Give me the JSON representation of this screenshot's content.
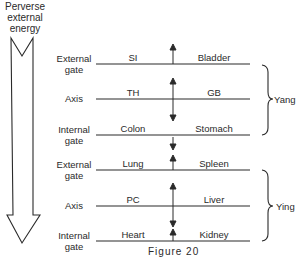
{
  "title": [
    "Perverse",
    "external",
    "energy"
  ],
  "rows": [
    {
      "gate": [
        "External",
        "gate"
      ],
      "left": "SI",
      "right": "Bladder"
    },
    {
      "gate": [
        "Axis"
      ],
      "left": "TH",
      "right": "GB"
    },
    {
      "gate": [
        "Internal",
        "gate"
      ],
      "left": "Colon",
      "right": "Stomach"
    },
    {
      "gate": [
        "External",
        "gate"
      ],
      "left": "Lung",
      "right": "Spleen"
    },
    {
      "gate": [
        "Axis"
      ],
      "left": "PC",
      "right": "Liver"
    },
    {
      "gate": [
        "Internal",
        "gate"
      ],
      "left": "Heart",
      "right": "Kidney"
    }
  ],
  "groups": [
    {
      "label": "Yang"
    },
    {
      "label": "Ying"
    }
  ],
  "caption": "Figure 20",
  "colors": {
    "ink": "#2a2a2a",
    "background": "#ffffff"
  }
}
